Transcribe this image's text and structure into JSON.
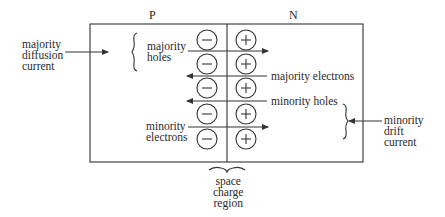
{
  "diagram": {
    "regions": {
      "p_label": "P",
      "n_label": "N"
    },
    "left_annotation": {
      "lines": [
        "majority",
        "diffusion",
        "current"
      ]
    },
    "right_annotation": {
      "lines": [
        "minority",
        "drift",
        "current"
      ]
    },
    "bottom_annotation": {
      "lines": [
        "space",
        "charge",
        "region"
      ]
    },
    "carrier_labels": {
      "majority_holes": [
        "majority",
        "holes"
      ],
      "majority_electrons": "majority electrons",
      "minority_holes": "minority holes",
      "minority_electrons": [
        "minority",
        "electrons"
      ]
    },
    "ions": {
      "p_side_symbol": "−",
      "n_side_symbol": "+",
      "rows": 5
    },
    "colors": {
      "line": "#333333",
      "text": "#2a2a2a",
      "background": "#ffffff"
    }
  }
}
